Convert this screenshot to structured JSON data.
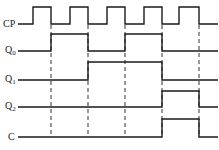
{
  "diagram": {
    "type": "timing-diagram",
    "colors": {
      "wave": "#1a1a1a",
      "dash": "#333333",
      "background": "#ffffff"
    },
    "signals": [
      {
        "id": "cp",
        "label": "CP",
        "sub": "",
        "label_y": 24,
        "high_y": 7,
        "low_y": 24,
        "points": [
          [
            18,
            "L"
          ],
          [
            33,
            "H"
          ],
          [
            51,
            "L"
          ],
          [
            70,
            "H"
          ],
          [
            88,
            "L"
          ],
          [
            107,
            "H"
          ],
          [
            125,
            "L"
          ],
          [
            144,
            "H"
          ],
          [
            162,
            "L"
          ],
          [
            179,
            "H"
          ],
          [
            199,
            "L"
          ],
          [
            218,
            "L"
          ]
        ]
      },
      {
        "id": "q0",
        "label": "Q",
        "sub": "0",
        "label_y": 51,
        "high_y": 34,
        "low_y": 51,
        "points": [
          [
            18,
            "L"
          ],
          [
            51,
            "H"
          ],
          [
            88,
            "L"
          ],
          [
            125,
            "H"
          ],
          [
            162,
            "L"
          ],
          [
            218,
            "L"
          ]
        ]
      },
      {
        "id": "q1",
        "label": "Q",
        "sub": "1",
        "label_y": 80,
        "high_y": 62,
        "low_y": 80,
        "points": [
          [
            18,
            "L"
          ],
          [
            88,
            "H"
          ],
          [
            162,
            "L"
          ],
          [
            218,
            "L"
          ]
        ]
      },
      {
        "id": "q2",
        "label": "Q",
        "sub": "2",
        "label_y": 107,
        "high_y": 91,
        "low_y": 107,
        "points": [
          [
            18,
            "L"
          ],
          [
            162,
            "H"
          ],
          [
            199,
            "L"
          ],
          [
            218,
            "L"
          ]
        ]
      },
      {
        "id": "c",
        "label": "C",
        "sub": "",
        "label_y": 137,
        "high_y": 119,
        "low_y": 137,
        "points": [
          [
            18,
            "L"
          ],
          [
            162,
            "H"
          ],
          [
            199,
            "L"
          ],
          [
            218,
            "L"
          ]
        ]
      }
    ],
    "dashed_markers": [
      {
        "x": 51,
        "y1": 25,
        "y2": 137
      },
      {
        "x": 88,
        "y1": 25,
        "y2": 137
      },
      {
        "x": 125,
        "y1": 25,
        "y2": 137
      },
      {
        "x": 162,
        "y1": 25,
        "y2": 137
      },
      {
        "x": 199,
        "y1": 25,
        "y2": 137
      }
    ]
  }
}
